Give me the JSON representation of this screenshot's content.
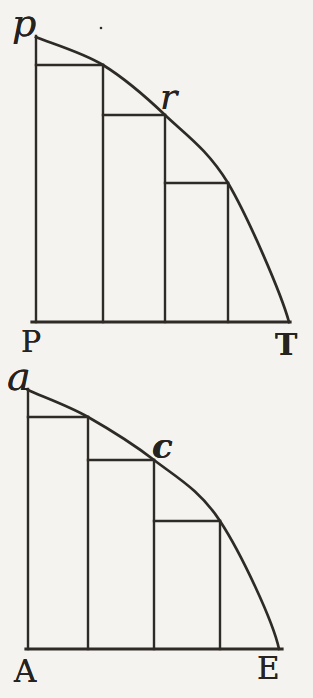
{
  "page": {
    "background_color": "#f4f3ef",
    "ink_color": "#2e2b26"
  },
  "figures": [
    {
      "id": "upper",
      "labels": {
        "top_left": "p",
        "curve_point": "r",
        "bottom_left": "P",
        "bottom_right": "T"
      }
    },
    {
      "id": "lower",
      "labels": {
        "top_left": "a",
        "curve_point": "c",
        "bottom_left": "A",
        "bottom_right": "E"
      }
    }
  ]
}
